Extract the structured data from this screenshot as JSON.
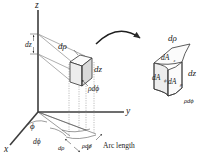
{
  "figure": {
    "background_color": "#ffffff",
    "ink_color": "#1a1a1a",
    "axes": {
      "z_label": "z",
      "y_label": "y",
      "x_label": "x"
    },
    "main_element": {
      "d_rho_label": "dρ",
      "dz_label": "dz",
      "rho_dphi_label": "ρdϕ"
    },
    "z_axis_extent": {
      "dz_label": "dz"
    },
    "ground_plane": {
      "phi_label": "ϕ",
      "d_phi_label": "dϕ",
      "d_rho_label": "dρ",
      "rho_dphi_label": "ρdϕ",
      "arc_length_label": "Arc length"
    },
    "detail_element": {
      "d_rho_label": "dρ",
      "dz_label": "dz",
      "rho_dphi_label": "ρdϕ",
      "dA_z_base": "dA",
      "dA_z_sub": "z",
      "dA_phi_base": "dA",
      "dA_phi_sub": "ϕ",
      "dA_rho_base": "dA",
      "dA_rho_sub": "ρ"
    }
  }
}
